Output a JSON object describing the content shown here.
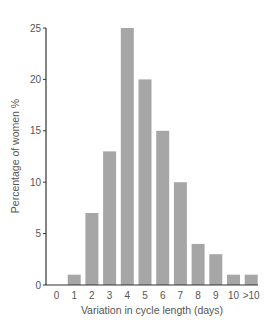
{
  "chart_data": {
    "type": "bar",
    "title": "",
    "xlabel": "Variation in cycle length (days)",
    "ylabel": "Percentage of women %",
    "categories": [
      "0",
      "1",
      "2",
      "3",
      "4",
      "5",
      "6",
      "7",
      "8",
      "9",
      "10",
      ">10"
    ],
    "values": [
      0,
      1,
      7,
      13,
      25,
      20,
      15,
      10,
      4,
      3,
      1,
      1
    ],
    "ylim": [
      0,
      25
    ],
    "yticks": [
      0,
      5,
      10,
      15,
      20,
      25
    ],
    "grid": false,
    "legend": null,
    "bar_color": "#a6a6a6"
  }
}
